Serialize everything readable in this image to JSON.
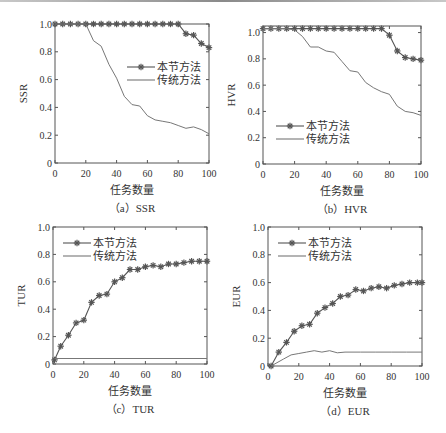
{
  "figure": {
    "xlabel": "任务数量",
    "legend": [
      "本节方法",
      "传统方法"
    ],
    "colors": {
      "axis": "#555555",
      "series_method": "#555555",
      "series_traditional": "#777777",
      "background": "#ffffff"
    }
  },
  "chart_data": [
    {
      "id": "a",
      "type": "line",
      "title": "（a）SSR",
      "caption_label": "（a）SSR",
      "xlabel": "任务数量",
      "ylabel": "SSR",
      "xlim": [
        0,
        100
      ],
      "ylim": [
        0,
        1.0
      ],
      "xticks": [
        0,
        20,
        40,
        60,
        80,
        100
      ],
      "yticks": [
        0,
        0.2,
        0.4,
        0.6,
        0.8,
        1.0
      ],
      "ytick_labels": [
        "0",
        "0.2",
        "0.4",
        "0.6",
        "0.8",
        "1.0"
      ],
      "legend_position": "upper right (middle)",
      "grid": false,
      "series": [
        {
          "name": "本节方法",
          "marker": "asterisk",
          "x": [
            0,
            5,
            10,
            15,
            20,
            25,
            30,
            35,
            40,
            45,
            50,
            55,
            60,
            65,
            70,
            75,
            80,
            85,
            90,
            95,
            100
          ],
          "y": [
            1.0,
            1.0,
            1.0,
            1.0,
            1.0,
            1.0,
            1.0,
            1.0,
            1.0,
            1.0,
            1.0,
            1.0,
            1.0,
            1.0,
            1.0,
            1.0,
            1.0,
            0.93,
            0.92,
            0.86,
            0.83
          ]
        },
        {
          "name": "传统方法",
          "marker": "none",
          "x": [
            0,
            5,
            10,
            15,
            20,
            25,
            30,
            35,
            40,
            45,
            50,
            55,
            60,
            65,
            70,
            75,
            80,
            85,
            90,
            95,
            100
          ],
          "y": [
            1.0,
            1.0,
            1.0,
            1.0,
            1.0,
            0.88,
            0.84,
            0.71,
            0.61,
            0.48,
            0.42,
            0.41,
            0.34,
            0.31,
            0.3,
            0.29,
            0.27,
            0.25,
            0.26,
            0.24,
            0.21
          ]
        }
      ]
    },
    {
      "id": "b",
      "type": "line",
      "title": "（b）HVR",
      "caption_label": "（b）HVR",
      "xlabel": "任务数量",
      "ylabel": "HVR",
      "xlim": [
        0,
        100
      ],
      "ylim": [
        0,
        1.05
      ],
      "xticks": [
        0,
        20,
        40,
        60,
        80,
        100
      ],
      "yticks": [
        0,
        0.2,
        0.4,
        0.6,
        0.8,
        1.0
      ],
      "ytick_labels": [
        "0",
        "0.2",
        "0.4",
        "0.6",
        "0.8",
        "1.0"
      ],
      "legend_position": "lower left",
      "grid": false,
      "series": [
        {
          "name": "本节方法",
          "marker": "asterisk",
          "x": [
            0,
            5,
            10,
            15,
            20,
            25,
            30,
            35,
            40,
            45,
            50,
            55,
            60,
            65,
            70,
            75,
            80,
            85,
            90,
            95,
            100
          ],
          "y": [
            1.03,
            1.03,
            1.03,
            1.03,
            1.03,
            1.03,
            1.03,
            1.03,
            1.03,
            1.03,
            1.03,
            1.03,
            1.03,
            1.03,
            1.03,
            1.03,
            0.98,
            0.86,
            0.81,
            0.8,
            0.79
          ]
        },
        {
          "name": "传统方法",
          "marker": "none",
          "x": [
            0,
            5,
            10,
            15,
            20,
            25,
            30,
            35,
            40,
            45,
            50,
            55,
            60,
            65,
            70,
            75,
            80,
            85,
            90,
            95,
            100
          ],
          "y": [
            1.03,
            1.03,
            1.03,
            1.03,
            1.02,
            0.97,
            0.89,
            0.89,
            0.86,
            0.85,
            0.78,
            0.71,
            0.7,
            0.62,
            0.58,
            0.55,
            0.53,
            0.44,
            0.4,
            0.39,
            0.37
          ]
        }
      ]
    },
    {
      "id": "c",
      "type": "line",
      "title": "（c）TUR",
      "caption_label": "（c）TUR",
      "xlabel": "任务数量",
      "ylabel": "TUR",
      "xlim": [
        0,
        100
      ],
      "ylim": [
        0,
        1.0
      ],
      "xticks": [
        0,
        20,
        40,
        60,
        80,
        100
      ],
      "yticks": [
        0,
        0.2,
        0.4,
        0.6,
        0.8,
        1.0
      ],
      "ytick_labels": [
        "0",
        "0.2",
        "0.4",
        "0.6",
        "0.8",
        "1.0"
      ],
      "legend_position": "upper left",
      "grid": false,
      "series": [
        {
          "name": "本节方法",
          "marker": "asterisk",
          "x": [
            1,
            5,
            10,
            15,
            20,
            25,
            30,
            35,
            40,
            45,
            50,
            55,
            60,
            65,
            70,
            75,
            80,
            85,
            90,
            95,
            100
          ],
          "y": [
            0.03,
            0.13,
            0.21,
            0.3,
            0.32,
            0.45,
            0.5,
            0.51,
            0.6,
            0.63,
            0.69,
            0.69,
            0.71,
            0.72,
            0.71,
            0.73,
            0.73,
            0.74,
            0.75,
            0.75,
            0.75
          ]
        },
        {
          "name": "传统方法",
          "marker": "none",
          "x": [
            1,
            100
          ],
          "y": [
            0.04,
            0.04
          ]
        }
      ]
    },
    {
      "id": "d",
      "type": "line",
      "title": "（d）EUR",
      "caption_label": "（d）EUR",
      "xlabel": "任务数量",
      "ylabel": "EUR",
      "xlim": [
        0,
        100
      ],
      "ylim": [
        0,
        1.0
      ],
      "xticks": [
        0,
        20,
        40,
        60,
        80,
        100
      ],
      "yticks": [
        0,
        0.2,
        0.4,
        0.6,
        0.8,
        1.0
      ],
      "ytick_labels": [
        "0",
        "0.2",
        "0.4",
        "0.6",
        "0.8",
        "1.0"
      ],
      "legend_position": "upper left",
      "grid": false,
      "series": [
        {
          "name": "本节方法",
          "marker": "asterisk",
          "x": [
            2,
            7,
            12,
            17,
            22,
            27,
            32,
            37,
            42,
            47,
            52,
            57,
            62,
            67,
            72,
            77,
            82,
            87,
            92,
            97,
            100
          ],
          "y": [
            0.0,
            0.1,
            0.17,
            0.25,
            0.29,
            0.3,
            0.38,
            0.42,
            0.45,
            0.5,
            0.51,
            0.55,
            0.54,
            0.56,
            0.57,
            0.56,
            0.58,
            0.59,
            0.6,
            0.6,
            0.6
          ]
        },
        {
          "name": "传统方法",
          "marker": "none",
          "x": [
            2,
            10,
            15,
            20,
            25,
            30,
            35,
            40,
            45,
            50,
            60,
            70,
            80,
            90,
            100
          ],
          "y": [
            0.0,
            0.05,
            0.08,
            0.09,
            0.1,
            0.11,
            0.1,
            0.11,
            0.095,
            0.1,
            0.1,
            0.1,
            0.1,
            0.1,
            0.1
          ]
        }
      ]
    }
  ]
}
